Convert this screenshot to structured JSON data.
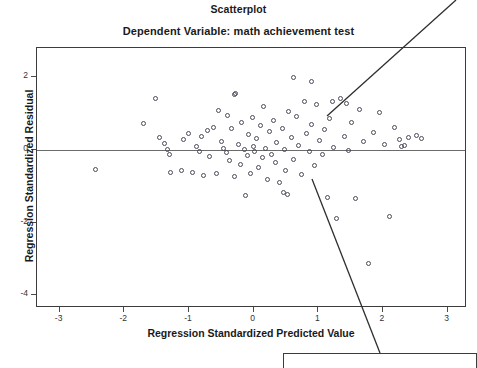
{
  "chart_data": {
    "type": "scatter",
    "title": "Scatterplot",
    "subtitle": "Dependent Variable: math achievement test",
    "xlabel": "Regression Standardized Predicted Value",
    "ylabel": "Regression Standardized Residual",
    "xlim": [
      -3.35,
      3.3
    ],
    "ylim": [
      -4.35,
      2.8
    ],
    "xticks": [
      -3,
      -2,
      -1,
      0,
      1,
      2,
      3
    ],
    "xtick_labels": [
      "-3",
      "-2",
      "-1",
      "0",
      "1",
      "2",
      "3"
    ],
    "yticks": [
      2,
      0,
      -2,
      -4
    ],
    "ytick_labels": [
      "2",
      "0",
      "-2",
      "-4"
    ],
    "grid": false,
    "legend": false,
    "reference_line": {
      "axis": "y",
      "value": 0
    },
    "marker": {
      "shape": "open-circle",
      "color": "#4a4a5a",
      "size": 5
    },
    "points": [
      [
        -2.45,
        -0.55
      ],
      [
        -1.7,
        0.72
      ],
      [
        -1.52,
        1.42
      ],
      [
        -1.46,
        0.34
      ],
      [
        -1.38,
        0.18
      ],
      [
        -1.33,
        0.02
      ],
      [
        -1.3,
        -0.12
      ],
      [
        -1.28,
        -0.62
      ],
      [
        -1.12,
        -0.58
      ],
      [
        -1.08,
        0.28
      ],
      [
        -1.0,
        0.45
      ],
      [
        -0.95,
        -0.62
      ],
      [
        -0.88,
        0.08
      ],
      [
        -0.84,
        -0.05
      ],
      [
        -0.8,
        0.38
      ],
      [
        -0.78,
        -0.7
      ],
      [
        -0.72,
        0.52
      ],
      [
        -0.68,
        -0.18
      ],
      [
        -0.62,
        0.62
      ],
      [
        -0.58,
        -0.64
      ],
      [
        -0.55,
        1.08
      ],
      [
        -0.5,
        0.22
      ],
      [
        -0.46,
        0.05
      ],
      [
        -0.42,
        -0.08
      ],
      [
        -0.4,
        0.95
      ],
      [
        -0.38,
        -0.3
      ],
      [
        -0.34,
        0.58
      ],
      [
        -0.3,
        -0.72
      ],
      [
        -0.28,
        1.55
      ],
      [
        -0.24,
        0.14
      ],
      [
        -0.2,
        -0.4
      ],
      [
        -0.18,
        0.76
      ],
      [
        -0.14,
        0.02
      ],
      [
        -0.1,
        -0.16
      ],
      [
        -0.08,
        0.42
      ],
      [
        -0.05,
        -0.66
      ],
      [
        -0.02,
        0.88
      ],
      [
        0.0,
        0.1
      ],
      [
        0.02,
        -0.05
      ],
      [
        0.05,
        0.3
      ],
      [
        0.08,
        -0.48
      ],
      [
        0.1,
        0.66
      ],
      [
        0.14,
        -0.22
      ],
      [
        0.16,
        1.18
      ],
      [
        0.18,
        0.04
      ],
      [
        0.22,
        -0.82
      ],
      [
        0.25,
        0.5
      ],
      [
        0.28,
        -0.12
      ],
      [
        0.3,
        0.82
      ],
      [
        0.34,
        -0.36
      ],
      [
        0.36,
        0.2
      ],
      [
        0.4,
        -0.9
      ],
      [
        0.44,
        0.6
      ],
      [
        0.48,
        0.0
      ],
      [
        0.5,
        -0.58
      ],
      [
        0.54,
        1.05
      ],
      [
        0.58,
        0.34
      ],
      [
        0.62,
        -0.26
      ],
      [
        0.66,
        0.92
      ],
      [
        0.7,
        0.12
      ],
      [
        0.74,
        -0.68
      ],
      [
        0.78,
        1.32
      ],
      [
        0.82,
        0.46
      ],
      [
        0.86,
        -0.04
      ],
      [
        0.9,
        0.7
      ],
      [
        0.94,
        -0.44
      ],
      [
        0.98,
        1.24
      ],
      [
        1.02,
        0.26
      ],
      [
        1.06,
        -0.14
      ],
      [
        1.1,
        0.56
      ],
      [
        1.14,
        -1.3
      ],
      [
        1.18,
        0.86
      ],
      [
        1.24,
        0.06
      ],
      [
        1.28,
        -1.9
      ],
      [
        1.34,
        1.4
      ],
      [
        1.4,
        0.38
      ],
      [
        1.46,
        -0.02
      ],
      [
        1.52,
        0.74
      ],
      [
        1.58,
        -1.34
      ],
      [
        1.64,
        1.1
      ],
      [
        1.7,
        0.22
      ],
      [
        1.78,
        -3.12
      ],
      [
        1.86,
        0.48
      ],
      [
        1.94,
        1.02
      ],
      [
        2.02,
        0.16
      ],
      [
        2.1,
        -1.82
      ],
      [
        2.18,
        0.62
      ],
      [
        2.26,
        0.28
      ],
      [
        2.4,
        0.34
      ],
      [
        2.52,
        0.4
      ],
      [
        2.6,
        0.3
      ],
      [
        0.62,
        1.98
      ],
      [
        0.9,
        1.88
      ],
      [
        -0.3,
        1.52
      ],
      [
        1.22,
        1.34
      ],
      [
        1.44,
        1.28
      ],
      [
        0.46,
        -1.18
      ],
      [
        0.52,
        -1.22
      ],
      [
        -0.12,
        -1.26
      ],
      [
        2.28,
        0.08
      ],
      [
        2.34,
        0.12
      ]
    ]
  },
  "annotations": {
    "callout_text": "",
    "leader_lines": [
      {
        "name": "upper-right-leader",
        "x1": 327,
        "y1": 116,
        "x2": 456,
        "y2": 0
      },
      {
        "name": "lower-right-leader",
        "x1": 312,
        "y1": 179,
        "x2": 380,
        "y2": 353
      }
    ]
  }
}
